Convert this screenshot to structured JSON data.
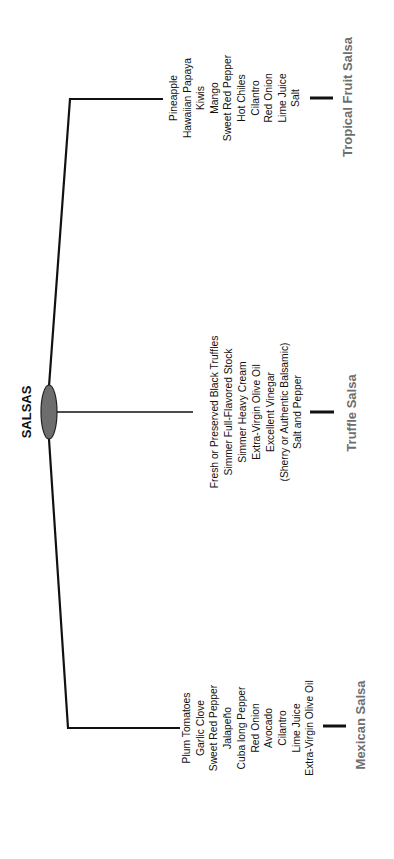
{
  "diagram": {
    "root": {
      "label": "SALSAS",
      "node_color": "#6d6d6d"
    },
    "branches": [
      {
        "label": "Tropical Fruit Salsa",
        "ingredients": [
          "Pineapple",
          "Hawaiian Papaya",
          "Kiwis",
          "Mango",
          "Sweet Red Pepper",
          "Hot Chiles",
          "Cilantro",
          "Red Onion",
          "Lime Juice",
          "Salt"
        ]
      },
      {
        "label": "Truffle Salsa",
        "ingredients": [
          "Fresh or Preserved Black Truffles",
          "Simmer Full-Flavored Stock",
          "Simmer Heavy Cream",
          "Extra-Virgin Olive Oil",
          "Excellent Vinegar",
          "(Sherry or Authentic Balsamic)",
          "Salt and Pepper"
        ]
      },
      {
        "label": "Mexican Salsa",
        "ingredients": [
          "Plum Tomatoes",
          "Garlic Clove",
          "Sweet Red Pepper",
          "Jalapeño",
          "Cuba long Pepper",
          "Red Onion",
          "Avocado",
          "Cilantro",
          "Lime Juice",
          "Extra-Virgin Olive Oil"
        ]
      }
    ],
    "colors": {
      "line": "#111111",
      "category_label": "#6e6e6e",
      "text": "#111111"
    }
  }
}
